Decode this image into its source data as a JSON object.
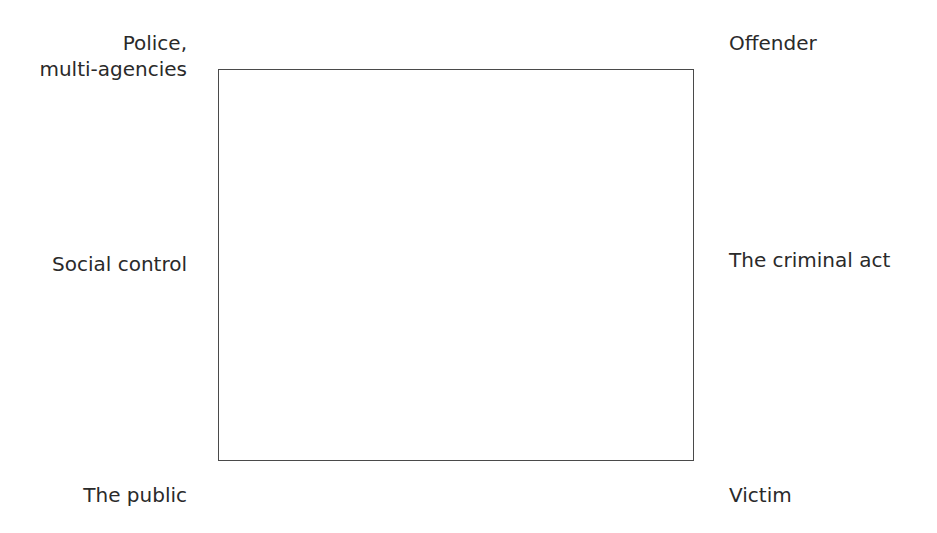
{
  "diagram": {
    "left_labels": {
      "top": [
        "Police,",
        "multi-agencies"
      ],
      "middle": "Social control",
      "bottom": "The public"
    },
    "right_labels": {
      "top": "Offender",
      "middle": "The criminal act",
      "bottom": "Victim"
    }
  }
}
